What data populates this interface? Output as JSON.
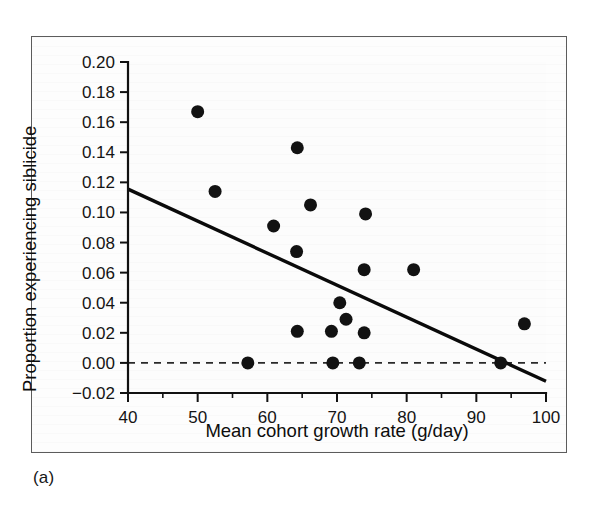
{
  "figure": {
    "caption": "(a)",
    "background_color": "#ffffff",
    "frame_color": "#5c5c5c",
    "ink_color": "#121212"
  },
  "chart_data": {
    "type": "scatter",
    "title": "",
    "xlabel": "Mean cohort growth rate (g/day)",
    "ylabel": "Proportion experiencing siblicide",
    "xlim": [
      40,
      100
    ],
    "ylim": [
      -0.02,
      0.2
    ],
    "grid": false,
    "legend": "none",
    "x_ticks": [
      40,
      50,
      60,
      70,
      80,
      90,
      100
    ],
    "x_tick_labels": [
      "40",
      "50",
      "60",
      "70",
      "80",
      "90",
      "100"
    ],
    "x_minor_ticks": [
      45,
      55,
      65,
      75,
      85,
      95
    ],
    "y_ticks": [
      -0.02,
      0.0,
      0.02,
      0.04,
      0.06,
      0.08,
      0.1,
      0.12,
      0.14,
      0.16,
      0.18,
      0.2
    ],
    "y_tick_labels": [
      "−0.02",
      "0.00",
      "0.02",
      "0.04",
      "0.06",
      "0.08",
      "0.10",
      "0.12",
      "0.14",
      "0.16",
      "0.18",
      "0.20"
    ],
    "marker": "filled-circle",
    "marker_color": "#121212",
    "marker_size_px": 13,
    "points": [
      {
        "x": 50.0,
        "y": 0.167
      },
      {
        "x": 52.5,
        "y": 0.114
      },
      {
        "x": 57.2,
        "y": 0.0
      },
      {
        "x": 60.9,
        "y": 0.091
      },
      {
        "x": 64.3,
        "y": 0.143
      },
      {
        "x": 64.2,
        "y": 0.074
      },
      {
        "x": 64.3,
        "y": 0.021
      },
      {
        "x": 66.2,
        "y": 0.105
      },
      {
        "x": 69.2,
        "y": 0.021
      },
      {
        "x": 69.4,
        "y": 0.0
      },
      {
        "x": 70.4,
        "y": 0.04
      },
      {
        "x": 71.3,
        "y": 0.029
      },
      {
        "x": 73.2,
        "y": 0.0
      },
      {
        "x": 73.9,
        "y": 0.02
      },
      {
        "x": 73.9,
        "y": 0.062
      },
      {
        "x": 74.1,
        "y": 0.099
      },
      {
        "x": 81.0,
        "y": 0.062
      },
      {
        "x": 93.5,
        "y": 0.0
      },
      {
        "x": 96.9,
        "y": 0.026
      }
    ],
    "series": [
      {
        "name": "regression-line",
        "type": "line",
        "style": "solid",
        "color": "#0a0a0a",
        "endpoints": [
          {
            "x": 40.0,
            "y": 0.1155
          },
          {
            "x": 100.0,
            "y": -0.0122
          }
        ]
      },
      {
        "name": "zero-reference-line",
        "type": "line",
        "style": "dashed",
        "color": "#2a2a2a",
        "endpoints": [
          {
            "x": 40.0,
            "y": 0.0
          },
          {
            "x": 100.0,
            "y": 0.0
          }
        ]
      }
    ]
  }
}
